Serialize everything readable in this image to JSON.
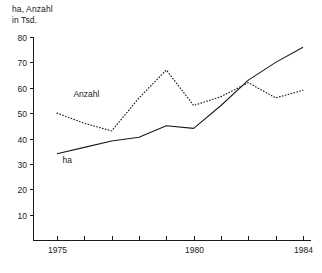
{
  "chart_data": {
    "type": "line",
    "title": "ha, Anzahl\nin Tsd.",
    "title_line1": "ha, Anzahl",
    "title_line2": "in Tsd.",
    "xlabel": "",
    "ylabel": "",
    "grid": false,
    "legend_position": "inline-labels",
    "x": [
      1975,
      1976,
      1977,
      1978,
      1979,
      1980,
      1981,
      1982,
      1983,
      1984
    ],
    "xlim": [
      1975,
      1984
    ],
    "ylim": [
      0,
      80
    ],
    "x_tick_labels": [
      "1975",
      "1980",
      "1984"
    ],
    "x_ticks_all": [
      1975,
      1976,
      1977,
      1978,
      1979,
      1980,
      1981,
      1982,
      1983,
      1984
    ],
    "y_ticks": [
      10,
      20,
      30,
      40,
      50,
      60,
      70,
      80
    ],
    "y_tick_labels": [
      "10",
      "20",
      "30",
      "40",
      "50",
      "60",
      "70",
      "80"
    ],
    "series": [
      {
        "name": "ha",
        "style": "solid",
        "color": "#1a1a1a",
        "values": [
          34,
          36.5,
          39,
          40.5,
          45,
          44,
          53,
          63,
          70,
          76
        ]
      },
      {
        "name": "Anzahl",
        "style": "dotted",
        "color": "#1a1a1a",
        "values": [
          50,
          46,
          43,
          56,
          67,
          53,
          56.5,
          62,
          56,
          59
        ]
      }
    ],
    "annotations": [
      {
        "text": "Anzahl",
        "x": 1975.6,
        "y": 56.5
      },
      {
        "text": "ha",
        "x": 1975.2,
        "y": 30.5
      }
    ]
  }
}
